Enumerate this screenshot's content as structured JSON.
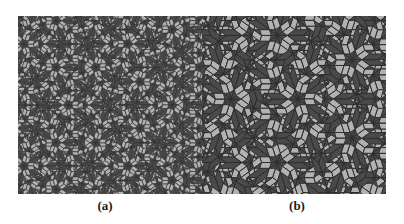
{
  "figure": {
    "name": "penrose-rhombic-tiling-comparison",
    "background_color": "#ffffff",
    "width": 404,
    "height": 224
  },
  "panels": [
    {
      "id": "a",
      "caption": "(a)",
      "x": 18,
      "y": 16,
      "width": 184,
      "height": 178,
      "tiling_type": "penrose-p3-rhombus",
      "tile_scale": 10.5,
      "symmetry": "5-fold",
      "colors": {
        "fat_rhombus": "#b2b2b2",
        "thin_rhombus": "#4a4a4a",
        "outline": "#2e2e2e",
        "background": "#b0b0b0"
      },
      "outline_width": 0.55
    },
    {
      "id": "b",
      "caption": "(b)",
      "x": 202,
      "y": 16,
      "width": 184,
      "height": 178,
      "tiling_type": "penrose-p3-rhombus",
      "tile_scale": 21.5,
      "symmetry": "5-fold",
      "colors": {
        "fat_rhombus": "#b2b2b2",
        "thin_rhombus": "#4a4a4a",
        "outline": "#2e2e2e",
        "background": "#b0b0b0"
      },
      "outline_width": 1.0
    }
  ],
  "chart_data": {
    "type": "table",
    "categories": [
      "(a)",
      "(b)"
    ],
    "series": [
      {
        "name": "relative tile edge length",
        "values": [
          1,
          2
        ]
      },
      {
        "name": "approx tiles visible",
        "values": [
          1400,
          350
        ]
      }
    ]
  }
}
